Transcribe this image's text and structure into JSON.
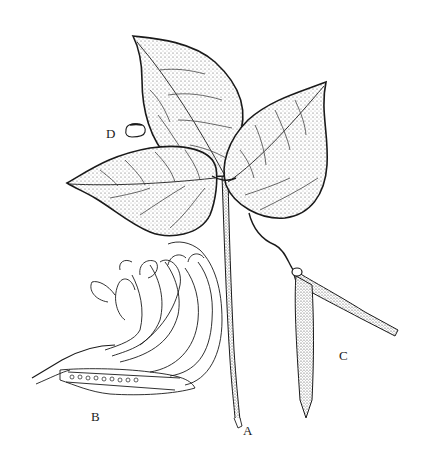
{
  "figure": {
    "colors": {
      "ink": "#1a1a1a",
      "background": "#ffffff",
      "stipple": "#555555"
    },
    "labels": {
      "a": "A",
      "b": "B",
      "c": "C",
      "d": "D"
    },
    "parts": [
      {
        "key": "A",
        "name": "trifoliate-leaf-stem"
      },
      {
        "key": "B",
        "name": "flower-section"
      },
      {
        "key": "C",
        "name": "pods"
      },
      {
        "key": "D",
        "name": "seed"
      }
    ]
  }
}
